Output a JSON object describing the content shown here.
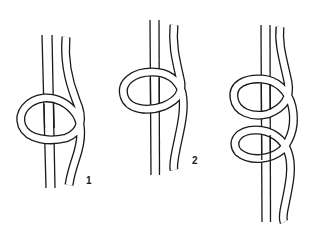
{
  "diagram": {
    "type": "knot-tying-steps",
    "figures": [
      {
        "id": "step-1",
        "label": "1",
        "description": "Rope wrapped once around standing cord, single loop"
      },
      {
        "id": "step-2",
        "label": "2",
        "description": "Loop tightened and rope crossing behind the standing cord"
      },
      {
        "id": "step-3",
        "label": "",
        "description": "Second turn added forming two stacked loops"
      }
    ],
    "colors": {
      "line": "#1a1a1a",
      "background": "#ffffff"
    }
  }
}
